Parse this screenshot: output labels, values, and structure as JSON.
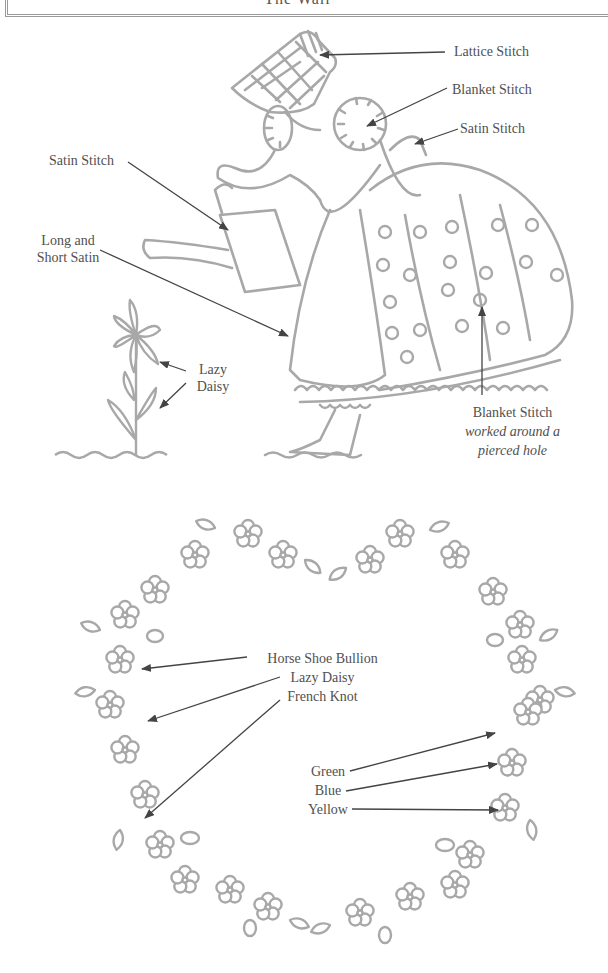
{
  "header": {
    "title": "The Wall"
  },
  "figure1": {
    "description": "Sunbonnet girl with watering can, embroidery stitch guide",
    "labels": {
      "lattice_stitch": "Lattice Stitch",
      "blanket_stitch_top": "Blanket Stitch",
      "satin_stitch_right": "Satin Stitch",
      "satin_stitch_left": "Satin Stitch",
      "long_short_1": "Long and",
      "long_short_2": "Short Satin",
      "lazy_daisy_1": "Lazy",
      "lazy_daisy_2": "Daisy",
      "blanket_hole_1": "Blanket Stitch",
      "blanket_hole_2": "worked around a",
      "blanket_hole_3": "pierced hole"
    }
  },
  "figure2": {
    "description": "Floral heart wreath, embroidery stitch and color guide",
    "labels": {
      "horse_shoe": "Horse Shoe Bullion",
      "lazy_daisy": "Lazy Daisy",
      "french_knot": "French Knot",
      "green": "Green",
      "blue": "Blue",
      "yellow": "Yellow"
    }
  },
  "colors": {
    "line_art": "#a8a8a8",
    "arrows": "#444444",
    "text": "#505050"
  }
}
